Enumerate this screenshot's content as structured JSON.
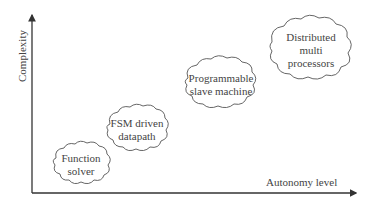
{
  "diagram": {
    "axes": {
      "y_label": "Complexity",
      "x_label": "Autonomy level"
    },
    "nodes": [
      {
        "id": "function-solver",
        "lines": [
          "Function",
          "solver"
        ]
      },
      {
        "id": "fsm-driven-datapath",
        "lines": [
          "FSM driven",
          "datapath"
        ]
      },
      {
        "id": "programmable-slave-machine",
        "lines": [
          "Programmable",
          "slave machine"
        ]
      },
      {
        "id": "distributed-multi-processors",
        "lines": [
          "Distributed",
          "multi",
          "processors"
        ]
      }
    ],
    "colors": {
      "stroke": "#333333",
      "text": "#444444",
      "background": "#ffffff"
    }
  }
}
